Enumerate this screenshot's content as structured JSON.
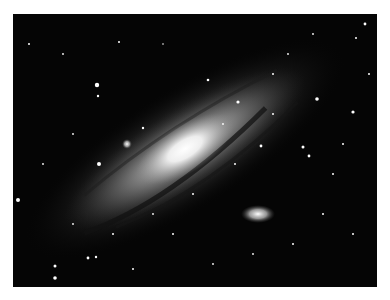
{
  "image": {
    "subject": "Andromeda galaxy",
    "description": "Grayscale photograph of a large spiral galaxy tilted diagonally with a bright core, dark dust lanes, a small elliptical satellite galaxy at lower right and a brighter compact companion near the upper left of the core, against a dense star field",
    "colors": {
      "border": "#ffffff",
      "sky": "#050505",
      "core": "#f2f2f2"
    }
  }
}
